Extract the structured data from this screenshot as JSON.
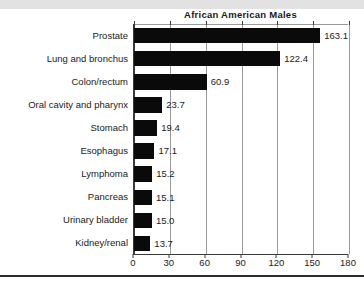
{
  "chart_data": {
    "type": "bar",
    "orientation": "horizontal",
    "title": "African American Males",
    "xlabel": "",
    "ylabel": "",
    "categories": [
      "Prostate",
      "Lung and bronchus",
      "Colon/rectum",
      "Oral cavity and pharynx",
      "Stomach",
      "Esophagus",
      "Lymphoma",
      "Pancreas",
      "Urinary bladder",
      "Kidney/renal"
    ],
    "values": [
      163.1,
      122.4,
      60.9,
      23.7,
      19.4,
      17.1,
      15.2,
      15.1,
      15.0,
      13.7
    ],
    "value_labels": [
      "163.1",
      "122.4",
      "60.9",
      "23.7",
      "19.4",
      "17.1",
      "15.2",
      "15.1",
      "15.0",
      "13.7"
    ],
    "xlim": [
      0,
      180
    ],
    "xticks": [
      0,
      30,
      60,
      90,
      120,
      150,
      180
    ],
    "xtick_labels": [
      "0",
      "30",
      "60",
      "90",
      "120",
      "150",
      "180"
    ],
    "grid": true,
    "grid_axis": "x",
    "legend": false,
    "bar_color": "#0a0a0a",
    "grid_color": "#9a9a9a",
    "axis_color": "#3a3a3a",
    "text_color": "#1a1a1a"
  }
}
